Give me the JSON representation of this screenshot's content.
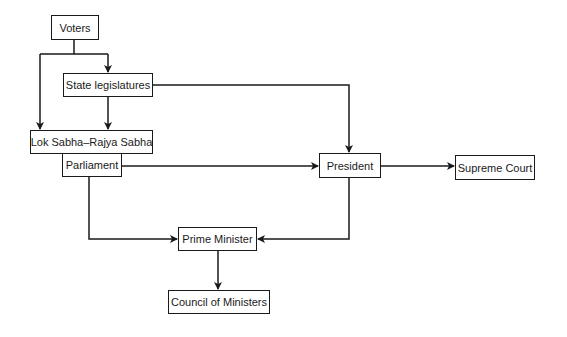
{
  "diagram": {
    "type": "flowchart",
    "title": "",
    "stroke_color": "#1a1a1a",
    "nodes": {
      "voters": "Voters",
      "state_legislatures": "State legislatures",
      "lok_sabha_rajya_sabha": "Lok Sabha–Rajya Sabha",
      "parliament": "Parliament",
      "president": "President",
      "supreme_court": "Supreme Court",
      "prime_minister": "Prime Minister",
      "council_of_ministers": "Council of Ministers"
    },
    "edges": [
      {
        "from": "Voters",
        "to": "State legislatures"
      },
      {
        "from": "Voters",
        "to": "Lok Sabha–Rajya Sabha"
      },
      {
        "from": "State legislatures",
        "to": "Lok Sabha–Rajya Sabha"
      },
      {
        "from": "State legislatures",
        "to": "President"
      },
      {
        "from": "Parliament",
        "to": "President"
      },
      {
        "from": "Parliament",
        "to": "Prime Minister"
      },
      {
        "from": "President",
        "to": "Supreme Court"
      },
      {
        "from": "President",
        "to": "Prime Minister"
      },
      {
        "from": "Prime Minister",
        "to": "Council of Ministers"
      }
    ]
  }
}
